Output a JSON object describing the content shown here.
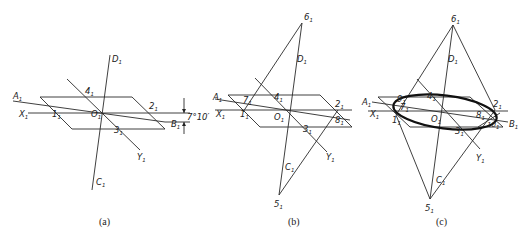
{
  "figure": {
    "panels": [
      {
        "id": "a",
        "caption": "(a)",
        "labels": {
          "A": "A",
          "X": "X",
          "one": "1",
          "O": "O",
          "four": "4",
          "two": "2",
          "three": "3",
          "B": "B",
          "Y": "Y",
          "D": "D",
          "C": "C"
        },
        "subscript": "1",
        "angle_annotation": "7°10′"
      },
      {
        "id": "b",
        "caption": "(b)",
        "labels": {
          "six": "6",
          "D": "D",
          "four": "4",
          "A": "A",
          "seven": "7",
          "X": "X",
          "one": "1",
          "O": "O",
          "two": "2",
          "eight": "8",
          "three": "3",
          "Y": "Y",
          "C": "C",
          "five": "5"
        },
        "subscript": "1"
      },
      {
        "id": "c",
        "caption": "(c)",
        "labels": {
          "six": "6",
          "D": "D",
          "four": "4",
          "nine": "9",
          "A": "A",
          "seven": "7",
          "X": "X",
          "one": "1",
          "O": "O",
          "two": "2",
          "eight": "8",
          "ten": "10",
          "B": "B",
          "three": "3",
          "Y": "Y",
          "C": "C",
          "five": "5"
        },
        "subscript": "1"
      }
    ],
    "colors": {
      "line": "#2a2a2a",
      "ellipse": "#111111",
      "background": "#ffffff"
    }
  }
}
